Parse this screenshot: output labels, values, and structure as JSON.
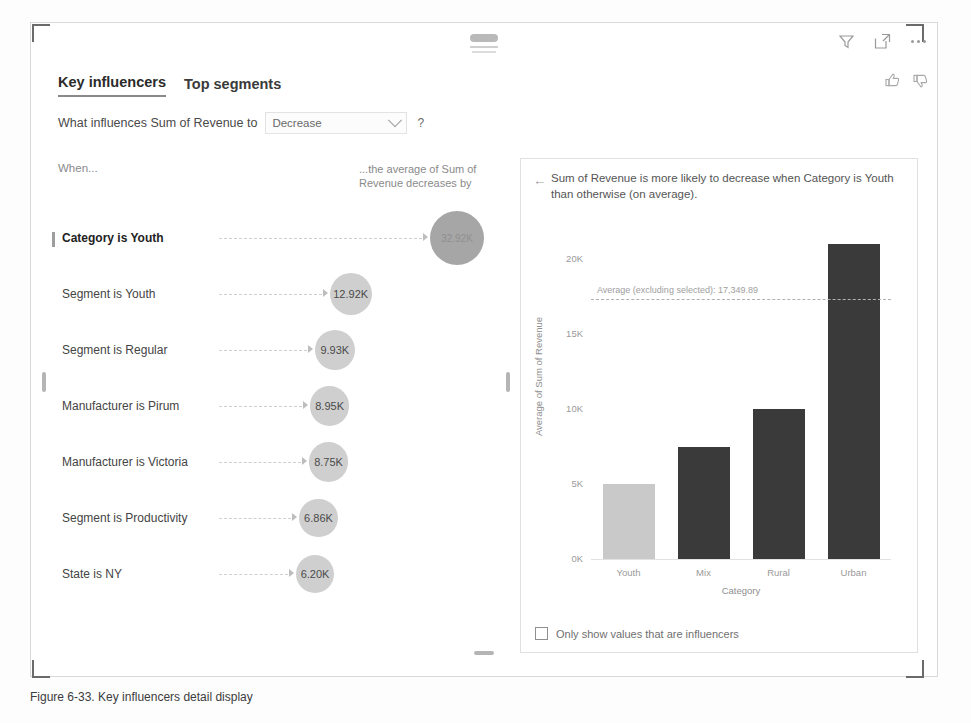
{
  "visual": {
    "tabs": [
      {
        "label": "Key influencers",
        "active": true
      },
      {
        "label": "Top segments",
        "active": false
      }
    ],
    "question_label": "What influences Sum of Revenue to",
    "metric_selected": "Decrease",
    "metric_options": [
      "Increase",
      "Decrease"
    ],
    "help": "?",
    "toolbar": {
      "filter": "filter-icon",
      "focus": "focus-mode-icon",
      "more": "more-options-icon"
    },
    "feedback": {
      "like": "thumbs-up-icon",
      "dislike": "thumbs-down-icon"
    }
  },
  "left_panel": {
    "when_header": "When...",
    "effect_header": "...the average of Sum of Revenue decreases by",
    "influencers": [
      {
        "label": "Category is Youth",
        "value": "32.92K",
        "selected": true
      },
      {
        "label": "Segment is Youth",
        "value": "12.92K",
        "selected": false
      },
      {
        "label": "Segment is Regular",
        "value": "9.93K",
        "selected": false
      },
      {
        "label": "Manufacturer is Pirum",
        "value": "8.95K",
        "selected": false
      },
      {
        "label": "Manufacturer is Victoria",
        "value": "8.75K",
        "selected": false
      },
      {
        "label": "Segment is Productivity",
        "value": "6.86K",
        "selected": false
      },
      {
        "label": "State is NY",
        "value": "6.20K",
        "selected": false
      }
    ]
  },
  "right_panel": {
    "back": "←",
    "detail_text": "Sum of Revenue is more likely to decrease when Category is Youth than otherwise (on average).",
    "checkbox_label": "Only show values that are influencers",
    "checkbox_checked": false
  },
  "chart_data": {
    "type": "bar",
    "title": "",
    "categories": [
      "Youth",
      "Mix",
      "Rural",
      "Urban"
    ],
    "values": [
      5000,
      7500,
      10000,
      21000
    ],
    "xlabel": "Category",
    "ylabel": "Average of Sum of Revenue",
    "ylim": [
      0,
      22000
    ],
    "yticks": [
      "0K",
      "5K",
      "10K",
      "15K",
      "20K"
    ],
    "ytick_values": [
      0,
      5000,
      10000,
      15000,
      20000
    ],
    "grid": false,
    "legend": "none",
    "reference_line": {
      "label": "Average (excluding selected): 17,349.89",
      "value": 17349.89
    },
    "colors": {
      "selected_bar": "#c9c9c9",
      "bar": "#3a3a3a"
    }
  },
  "caption": "Figure 6-33. Key influencers detail display"
}
